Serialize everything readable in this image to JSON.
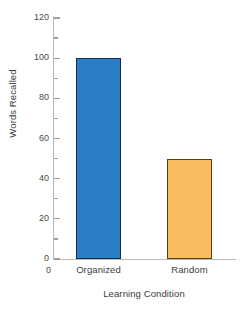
{
  "chart_data": {
    "type": "bar",
    "title": "",
    "xlabel": "Learning Condition",
    "ylabel": "Words Recalled",
    "categories": [
      "Organized",
      "Random"
    ],
    "values": [
      100,
      50
    ],
    "ylim": [
      0,
      120
    ],
    "y_major_ticks": [
      0,
      20,
      40,
      60,
      80,
      100,
      120
    ],
    "y_minor_ticks": [
      10,
      30,
      50,
      70,
      90,
      110
    ],
    "y_tick_labels": [
      "0",
      "20",
      "40",
      "60",
      "80",
      "100",
      "120"
    ],
    "origin_label": "0",
    "grid": false,
    "legend": false,
    "legend_position": "none",
    "bar_colors": [
      "#2a7fc4",
      "#f9bc5f"
    ],
    "bar_edge_colors": [
      "#1b2b4a",
      "#5a3e14"
    ],
    "axis_color": "#b9b9b9",
    "text_color": "#3b3b3b"
  }
}
